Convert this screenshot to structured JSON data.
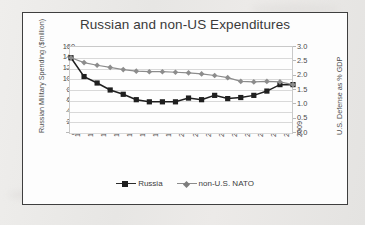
{
  "chart_data": {
    "type": "line",
    "title": "Russian and non-US Expenditures",
    "grid": true,
    "legend_position": "bottom",
    "x": [
      "1992",
      "1993",
      "1994",
      "1995",
      "1996",
      "1997",
      "1998",
      "1999",
      "2000",
      "2001",
      "2002",
      "2003",
      "2004",
      "2005",
      "2006",
      "2007",
      "2008",
      "2009"
    ],
    "xlabel": "",
    "axes": [
      {
        "id": "left",
        "ylabel": "Russian Military Spending ($million)",
        "ylim": [
          0,
          160
        ],
        "yticks": [
          "0",
          "20",
          "40",
          "60",
          "80",
          "100",
          "120",
          "140",
          "160"
        ]
      },
      {
        "id": "right",
        "ylabel": "U.S. Defense as % GDP",
        "ylim": [
          0.0,
          3.0
        ],
        "yticks": [
          "0.0",
          "0.5",
          "1.0",
          "1.5",
          "2.0",
          "2.5",
          "3.0"
        ]
      }
    ],
    "series": [
      {
        "name": "Russia",
        "axis": "left",
        "color": "#1f1f1f",
        "marker": "square",
        "values": [
          140,
          105,
          93,
          80,
          72,
          62,
          58,
          58,
          58,
          65,
          62,
          70,
          64,
          66,
          70,
          78,
          90,
          90
        ]
      },
      {
        "name": "non-U.S. NATO",
        "axis": "left",
        "color": "#8c8c8c",
        "marker": "diamond",
        "values": [
          140,
          131,
          126,
          122,
          118,
          115,
          114,
          114,
          113,
          112,
          110,
          107,
          103,
          96,
          95,
          96,
          95,
          90
        ]
      }
    ],
    "legend": [
      {
        "label": "Russia",
        "marker": "square",
        "color": "#1f1f1f"
      },
      {
        "label": "non-U.S. NATO",
        "marker": "diamond",
        "color": "#8c8c8c"
      }
    ]
  }
}
